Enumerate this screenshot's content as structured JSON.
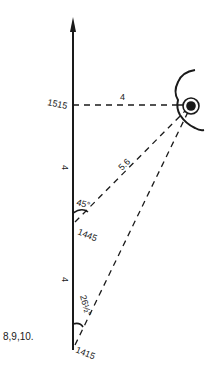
{
  "figure_label": "8,9,10.",
  "course_line": {
    "times": {
      "t1": "1515",
      "t2": "1445",
      "t3": "1415"
    },
    "segment_distances": {
      "upper": "4",
      "lower": "4"
    }
  },
  "bearings": {
    "first": {
      "angle": "26½°",
      "time": "1415"
    },
    "second": {
      "angle": "45°",
      "time": "1445",
      "distance": "5.6"
    },
    "abeam": {
      "time": "1515",
      "distance": "4"
    }
  },
  "landmark": "lighthouse-on-coast",
  "colors": {
    "ink": "#1a1a1a",
    "background": "#ffffff"
  }
}
